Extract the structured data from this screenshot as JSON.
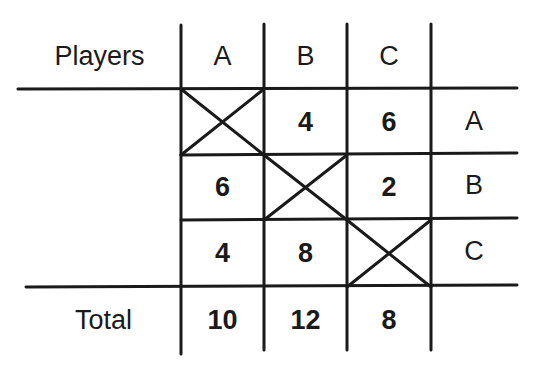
{
  "table": {
    "corner_label": "Players",
    "column_headers": [
      "A",
      "B",
      "C"
    ],
    "row_labels": [
      "A",
      "B",
      "C"
    ],
    "cells": [
      [
        "",
        "4",
        "6"
      ],
      [
        "6",
        "",
        "2"
      ],
      [
        "4",
        "8",
        ""
      ]
    ],
    "diagonal": "crossed-out",
    "total_label": "Total",
    "totals": [
      "10",
      "12",
      "8"
    ]
  },
  "colors": {
    "line": "#1a1a1a",
    "background": "#ffffff",
    "text": "#1a1a1a"
  }
}
